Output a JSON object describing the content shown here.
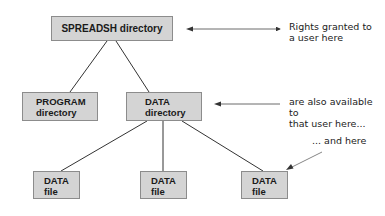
{
  "diagram": {
    "nodes": {
      "spreadsh": {
        "label": "SPREADSH directory"
      },
      "program": {
        "line1": "PROGRAM",
        "line2": "directory"
      },
      "data_dir": {
        "line1": "DATA",
        "line2": "directory"
      },
      "file1": {
        "line1": "DATA",
        "line2": "file"
      },
      "file2": {
        "line1": "DATA",
        "line2": "file"
      },
      "file3": {
        "line1": "DATA",
        "line2": "file"
      }
    },
    "annotations": {
      "rights": {
        "line1": "Rights granted to",
        "line2": "a user here"
      },
      "available": {
        "line1": "are also available to",
        "line2": "that user here..."
      },
      "and_here": {
        "text": "... and here"
      }
    },
    "colors": {
      "box_fill": "#d4d4d4",
      "box_border": "#8c8c8c",
      "line": "#333333",
      "arrow": "#555555"
    }
  }
}
